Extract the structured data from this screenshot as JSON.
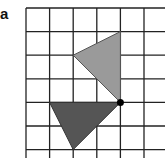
{
  "figure": {
    "label": "a",
    "grid": {
      "origin_x": 26,
      "origin_y": 8,
      "cell": 23.6,
      "columns": 7,
      "rows": 7,
      "line_color": "#222222"
    },
    "shapes": [
      {
        "name": "light-triangle",
        "fill": "#9a9a9a",
        "stroke": "#555555",
        "grid_vertices": [
          [
            4,
            1
          ],
          [
            2,
            2
          ],
          [
            4,
            4
          ]
        ]
      },
      {
        "name": "dark-triangle",
        "fill": "#555555",
        "stroke": "#333333",
        "grid_vertices": [
          [
            1,
            4
          ],
          [
            4,
            4
          ],
          [
            2,
            6
          ]
        ]
      }
    ],
    "point": {
      "name": "center-of-rotation",
      "grid_position": [
        4,
        4
      ],
      "color": "#000000",
      "radius": 3.5
    }
  }
}
